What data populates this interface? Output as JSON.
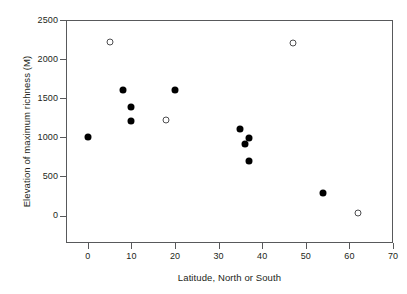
{
  "chart_data": {
    "type": "scatter",
    "title": "",
    "xlabel": "Latitude, North or South",
    "ylabel": "Elevation of maximum richness (M)",
    "xlim": [
      -5,
      70
    ],
    "ylim": [
      -350,
      2500
    ],
    "grid": false,
    "legend": "none",
    "xticks": [
      0,
      10,
      20,
      30,
      40,
      50,
      60,
      70
    ],
    "xtick_labels": [
      "0",
      "10",
      "20",
      "30",
      "40",
      "50",
      "60",
      "70"
    ],
    "yticks": [
      0,
      500,
      1000,
      1500,
      2000,
      2500
    ],
    "ytick_labels": [
      "0",
      "500",
      "1000",
      "1500",
      "2000",
      "2500"
    ],
    "series": [
      {
        "name": "filled",
        "marker": "filled-circle",
        "color": "#000000",
        "points": [
          {
            "x": 0,
            "y": 1000
          },
          {
            "x": 8,
            "y": 1610
          },
          {
            "x": 10,
            "y": 1390
          },
          {
            "x": 10,
            "y": 1205
          },
          {
            "x": 20,
            "y": 1610
          },
          {
            "x": 35,
            "y": 1110
          },
          {
            "x": 36,
            "y": 910
          },
          {
            "x": 37,
            "y": 990
          },
          {
            "x": 37,
            "y": 700
          },
          {
            "x": 54,
            "y": 290
          }
        ]
      },
      {
        "name": "open",
        "marker": "open-circle",
        "color": "#4d4d4f",
        "points": [
          {
            "x": 5,
            "y": 2215
          },
          {
            "x": 18,
            "y": 1225
          },
          {
            "x": 47,
            "y": 2200
          },
          {
            "x": 62,
            "y": 30
          }
        ]
      }
    ]
  }
}
